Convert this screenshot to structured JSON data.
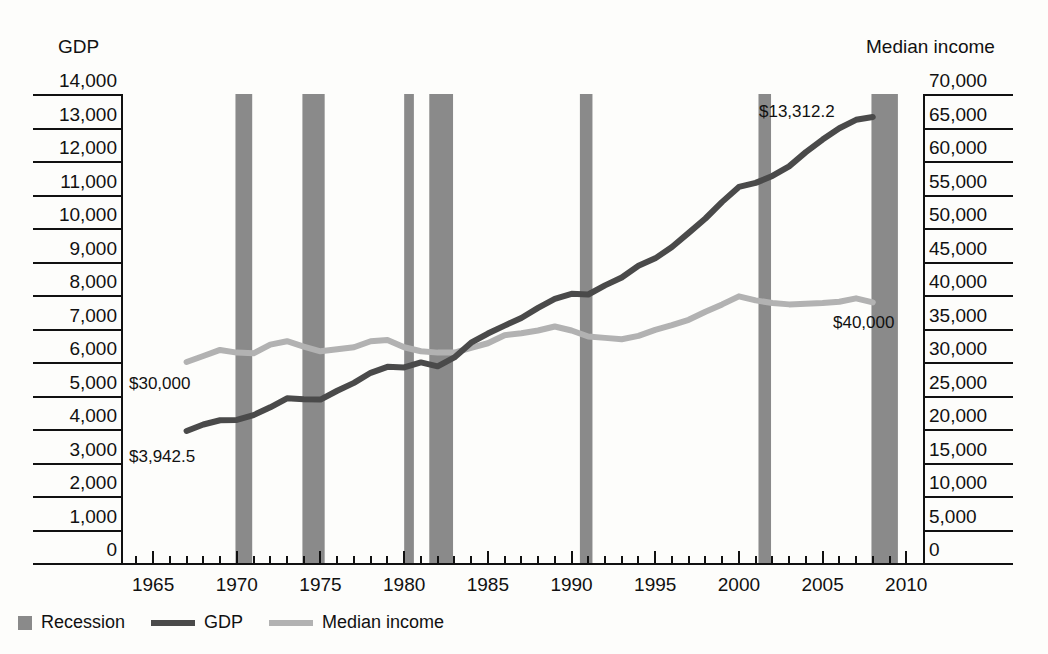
{
  "axes": {
    "left_title": "GDP",
    "right_title": "Median income",
    "left_ticks": [
      "14,000",
      "13,000",
      "12,000",
      "11,000",
      "10,000",
      "9,000",
      "8,000",
      "7,000",
      "6,000",
      "5,000",
      "4,000",
      "3,000",
      "2,000",
      "1,000",
      "0"
    ],
    "right_ticks": [
      "70,000",
      "65,000",
      "60,000",
      "55,000",
      "50,000",
      "45,000",
      "40,000",
      "35,000",
      "30,000",
      "25,000",
      "20,000",
      "15,000",
      "10,000",
      "5,000",
      "0"
    ],
    "x_ticks": [
      "1965",
      "1970",
      "1975",
      "1980",
      "1985",
      "1990",
      "1995",
      "2000",
      "2005",
      "2010"
    ]
  },
  "legend": {
    "items": [
      {
        "label": "Recession",
        "marker": "box",
        "color": "#8a8a8a"
      },
      {
        "label": "GDP",
        "marker": "line",
        "color": "#4a4a4a"
      },
      {
        "label": "Median income",
        "marker": "line",
        "color": "#b2b2b2"
      }
    ]
  },
  "annotations": [
    {
      "name": "gdp-start-label",
      "text": "$3,942.5",
      "x": 129,
      "y": 447
    },
    {
      "name": "gdp-end-label",
      "text": "$13,312.2",
      "x": 759,
      "y": 102
    },
    {
      "name": "income-start-label",
      "text": "$30,000",
      "x": 129,
      "y": 374
    },
    {
      "name": "income-end-label",
      "text": "$40,000",
      "x": 833,
      "y": 313
    }
  ],
  "colors": {
    "gdp": "#4a4a4a",
    "income": "#b2b2b2",
    "recession": "#8a8a8a",
    "axis": "#111111",
    "background": "#fdfdfb"
  },
  "chart_data": {
    "type": "line",
    "title": "",
    "xlabel": "",
    "ylabel": "GDP",
    "y2label": "Median income",
    "xlim": [
      1963.2,
      2011.0
    ],
    "ylim": [
      0,
      14000
    ],
    "y2lim": [
      0,
      70000
    ],
    "grid": false,
    "legend_position": "bottom-left",
    "x": [
      1967,
      1968,
      1969,
      1970,
      1971,
      1972,
      1973,
      1974,
      1975,
      1976,
      1977,
      1978,
      1979,
      1980,
      1981,
      1982,
      1983,
      1984,
      1985,
      1986,
      1987,
      1988,
      1989,
      1990,
      1991,
      1992,
      1993,
      1994,
      1995,
      1996,
      1997,
      1998,
      1999,
      2000,
      2001,
      2002,
      2003,
      2004,
      2005,
      2006,
      2007,
      2008
    ],
    "series": [
      {
        "name": "GDP",
        "axis": "left",
        "units": "billions of chained dollars",
        "color": "#4a4a4a",
        "start_label": "$3,942.5",
        "end_label": "$13,312.2",
        "values": [
          3942.5,
          4133.4,
          4261.8,
          4269.9,
          4413.3,
          4647.7,
          4917.0,
          4889.9,
          4879.5,
          5141.3,
          5377.7,
          5677.6,
          5855.0,
          5839.0,
          5987.2,
          5870.9,
          6136.2,
          6577.1,
          6849.3,
          7086.5,
          7313.3,
          7613.9,
          7885.9,
          8033.9,
          8015.1,
          8287.1,
          8523.4,
          8870.7,
          9093.7,
          9433.9,
          9854.3,
          10283.5,
          10779.8,
          11226.0,
          11347.2,
          11553.0,
          11840.7,
          12263.8,
          12638.4,
          12976.2,
          13228.9,
          13312.2
        ]
      },
      {
        "name": "Median income",
        "axis": "right",
        "units": "dollars",
        "color": "#b2b2b2",
        "start_label": "$30,000",
        "end_label": "$40,000",
        "values": [
          30000,
          30900,
          31800,
          31400,
          31300,
          32600,
          33100,
          32300,
          31600,
          31900,
          32200,
          33100,
          33300,
          32200,
          31600,
          31400,
          31400,
          32100,
          32800,
          34000,
          34300,
          34700,
          35300,
          34700,
          33800,
          33600,
          33400,
          33900,
          34800,
          35500,
          36300,
          37500,
          38600,
          39800,
          39200,
          38800,
          38600,
          38700,
          38800,
          39000,
          39500,
          38900
        ]
      }
    ],
    "recessions": [
      {
        "start": 1969.92,
        "end": 1970.92
      },
      {
        "start": 1973.92,
        "end": 1975.25
      },
      {
        "start": 1980.0,
        "end": 1980.58
      },
      {
        "start": 1981.5,
        "end": 1982.92
      },
      {
        "start": 1990.5,
        "end": 1991.25
      },
      {
        "start": 2001.17,
        "end": 2001.92
      },
      {
        "start": 2007.92,
        "end": 2009.5
      }
    ]
  }
}
